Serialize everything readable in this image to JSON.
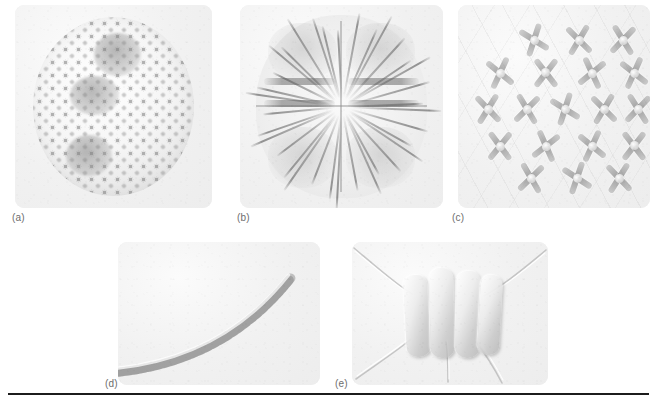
{
  "figure": {
    "type": "micrograph-plate",
    "background_color": "#ffffff",
    "panel_background_color": "#f1f1f1",
    "rule_color": "#1c1c1c",
    "caption_color": "#6d6d6d",
    "panel_count": 5,
    "rows": 2
  },
  "panels": [
    {
      "id": "a",
      "label": "(a)",
      "subject": "spherical-colony-with-daughter-colonies",
      "row": 1,
      "column": 1,
      "cell_count_visible": 180,
      "daughter_colony_count": 3
    },
    {
      "id": "b",
      "label": "(b)",
      "subject": "four-lobed-desmid-with-radiating-spines",
      "row": 1,
      "column": 2,
      "lobe_count": 4,
      "spine_count_visible": 34
    },
    {
      "id": "c",
      "label": "(c)",
      "subject": "colony-of-cross-shaped-cells",
      "row": 1,
      "column": 3,
      "cell_count_visible": 20,
      "arm_count_per_cell": 4
    },
    {
      "id": "d",
      "label": "(d)",
      "subject": "curved-filament-chain-of-cells",
      "row": 2,
      "column": 1,
      "cell_count_visible": 26
    },
    {
      "id": "e",
      "label": "(e)",
      "subject": "four-celled-coenobium-with-bristles",
      "row": 2,
      "column": 2,
      "cell_count_visible": 4,
      "bristle_count_visible": 4
    }
  ]
}
